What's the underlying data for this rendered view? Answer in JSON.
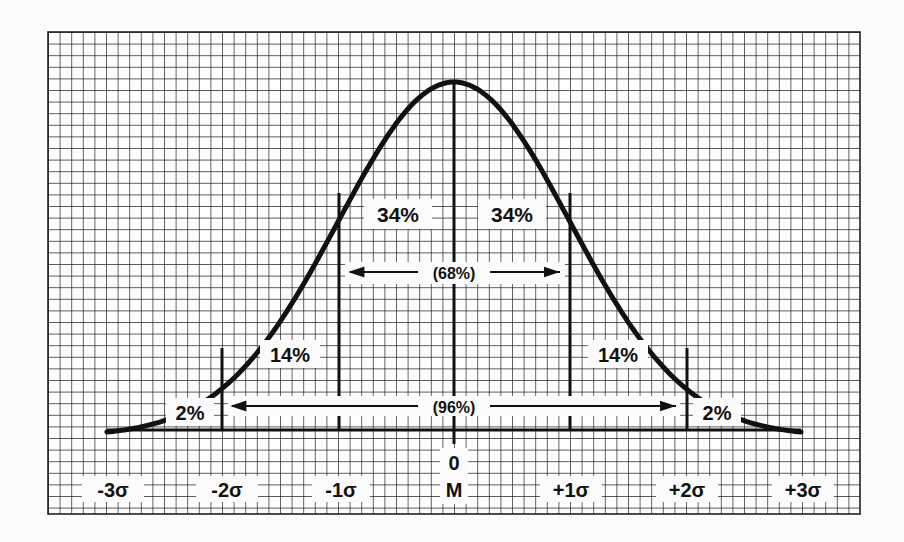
{
  "chart_data": {
    "type": "area",
    "title": "",
    "xlabel": "",
    "ylabel": "",
    "grid": true,
    "x_ticks": [
      "-3σ",
      "-2σ",
      "-1σ",
      "0\nM",
      "+1σ",
      "+2σ",
      "+3σ"
    ],
    "x_values": [
      -3,
      -2,
      -1,
      0,
      1,
      2,
      3
    ],
    "xlim": [
      -3,
      3
    ],
    "regions": [
      {
        "from": -3,
        "to": -2,
        "label": "2%",
        "value": 2
      },
      {
        "from": -2,
        "to": -1,
        "label": "14%",
        "value": 14
      },
      {
        "from": -1,
        "to": 0,
        "label": "34%",
        "value": 34
      },
      {
        "from": 0,
        "to": 1,
        "label": "34%",
        "value": 34
      },
      {
        "from": 1,
        "to": 2,
        "label": "14%",
        "value": 14
      },
      {
        "from": 2,
        "to": 3,
        "label": "2%",
        "value": 2
      }
    ],
    "spans": [
      {
        "from": -1,
        "to": 1,
        "label": "(68%)",
        "value": 68
      },
      {
        "from": -2,
        "to": 2,
        "label": "(96%)",
        "value": 96
      }
    ]
  },
  "labels": {
    "pct_left_outer": "2%",
    "pct_left_mid": "14%",
    "pct_left_inner": "34%",
    "pct_right_inner": "34%",
    "pct_right_mid": "14%",
    "pct_right_outer": "2%",
    "span_68": "(68%)",
    "span_96": "(96%)",
    "tick_m3": "-3σ",
    "tick_m2": "-2σ",
    "tick_m1": "-1σ",
    "tick_0": "0",
    "tick_M": "M",
    "tick_p1": "+1σ",
    "tick_p2": "+2σ",
    "tick_p3": "+3σ"
  },
  "colors": {
    "ink": "#111111",
    "paper": "#fbfbfb"
  }
}
